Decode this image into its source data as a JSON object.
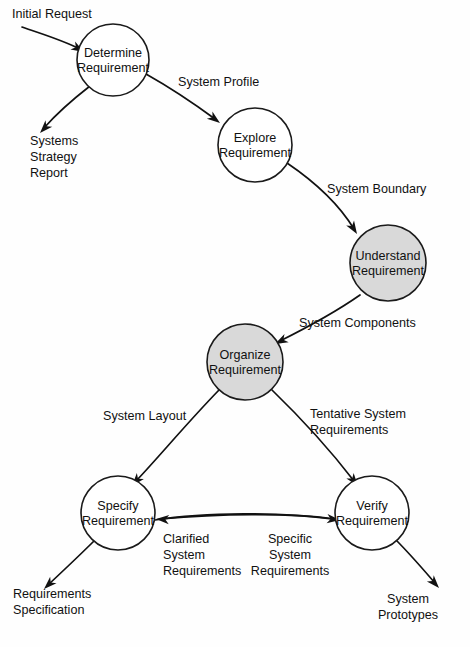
{
  "diagram": {
    "type": "data-flow-diagram",
    "colors": {
      "stroke": "#111111",
      "node_fill": "#ffffff",
      "node_fill_shaded": "#d9d9d9",
      "background": "#fefefe"
    },
    "nodes": [
      {
        "id": "determine",
        "line1": "Determine",
        "line2": "Requirement",
        "cx": 113,
        "cy": 60,
        "r": 36,
        "shaded": false
      },
      {
        "id": "explore",
        "line1": "Explore",
        "line2": "Requirement",
        "cx": 255,
        "cy": 145,
        "r": 37,
        "shaded": false
      },
      {
        "id": "understand",
        "line1": "Understand",
        "line2": "Requirement",
        "cx": 388,
        "cy": 263,
        "r": 38,
        "shaded": true
      },
      {
        "id": "organize",
        "line1": "Organize",
        "line2": "Requirement",
        "cx": 245,
        "cy": 362,
        "r": 38,
        "shaded": true
      },
      {
        "id": "specify",
        "line1": "Specify",
        "line2": "Requirement",
        "cx": 118,
        "cy": 513,
        "r": 37,
        "shaded": false
      },
      {
        "id": "verify",
        "line1": "Verify",
        "line2": "Requirement",
        "cx": 372,
        "cy": 513,
        "r": 37,
        "shaded": false
      }
    ],
    "external_labels": [
      {
        "id": "initial-request",
        "lines": [
          "Initial Request"
        ],
        "x": 12,
        "y": 18,
        "align": "start"
      },
      {
        "id": "systems-strategy-report",
        "lines": [
          "Systems",
          "Strategy",
          "Report"
        ],
        "x": 30,
        "y": 145,
        "align": "start"
      },
      {
        "id": "requirements-specification",
        "lines": [
          "Requirements",
          "Specification"
        ],
        "x": 13,
        "y": 598,
        "align": "start"
      },
      {
        "id": "system-prototypes",
        "lines": [
          "System",
          "Prototypes"
        ],
        "x": 408,
        "y": 603,
        "align": "middle"
      }
    ],
    "flow_labels": [
      {
        "id": "system-profile",
        "lines": [
          "System Profile"
        ],
        "x": 178,
        "y": 86,
        "align": "start"
      },
      {
        "id": "system-boundary",
        "lines": [
          "System Boundary"
        ],
        "x": 327,
        "y": 193,
        "align": "start"
      },
      {
        "id": "system-components",
        "lines": [
          "System Components"
        ],
        "x": 299,
        "y": 327,
        "align": "start"
      },
      {
        "id": "system-layout",
        "lines": [
          "System Layout"
        ],
        "x": 103,
        "y": 420,
        "align": "start"
      },
      {
        "id": "tentative-system-requirements",
        "lines": [
          "Tentative System",
          "Requirements"
        ],
        "x": 310,
        "y": 418,
        "align": "start"
      },
      {
        "id": "clarified-system-requirements",
        "lines": [
          "Clarified",
          "System",
          "Requirements"
        ],
        "x": 163,
        "y": 543,
        "align": "start"
      },
      {
        "id": "specific-system-requirements",
        "lines": [
          "Specific",
          "System",
          "Requirements"
        ],
        "x": 290,
        "y": 543,
        "align": "middle"
      }
    ],
    "edges": [
      {
        "id": "initial-request-to-determine",
        "from": "initial-request",
        "to": "determine",
        "path": "M 22 27 C 48 36, 62 40, 80 49",
        "arrow_x": 84,
        "arrow_y": 52,
        "arrow_angle": 30
      },
      {
        "id": "determine-to-systems-strategy-report",
        "from": "determine",
        "to": "systems-strategy-report",
        "path": "M 90 86 C 72 100, 58 112, 44 128",
        "arrow_x": 40,
        "arrow_y": 133,
        "arrow_angle": 133
      },
      {
        "id": "determine-to-explore",
        "from": "determine",
        "to": "explore",
        "path": "M 146 74 C 178 92, 196 105, 215 119",
        "arrow_x": 220,
        "arrow_y": 123,
        "arrow_angle": 37
      },
      {
        "id": "explore-to-understand",
        "from": "explore",
        "to": "understand",
        "path": "M 287 163 C 318 184, 340 206, 354 229",
        "arrow_x": 357,
        "arrow_y": 234,
        "arrow_angle": 58
      },
      {
        "id": "understand-to-organize",
        "from": "understand",
        "to": "organize",
        "path": "M 360 295 C 330 316, 302 330, 280 341",
        "arrow_x": 275,
        "arrow_y": 344,
        "arrow_angle": 153
      },
      {
        "id": "organize-to-specify",
        "from": "organize",
        "to": "specify",
        "path": "M 219 390 C 186 424, 158 458, 136 481",
        "arrow_x": 132,
        "arrow_y": 486,
        "arrow_angle": 130
      },
      {
        "id": "organize-to-verify",
        "from": "organize",
        "to": "verify",
        "path": "M 272 390 C 304 421, 334 455, 354 481",
        "arrow_x": 358,
        "arrow_y": 486,
        "arrow_angle": 52
      },
      {
        "id": "verify-to-specify",
        "from": "verify",
        "to": "specify",
        "path": "M 338 520 C 290 512, 215 514, 161 519",
        "arrow_x": 156,
        "arrow_y": 519,
        "arrow_angle": 183
      },
      {
        "id": "specify-to-requirements-specification",
        "from": "specify",
        "to": "requirements-specification",
        "path": "M 95 540 C 80 555, 64 570, 48 585",
        "arrow_x": 44,
        "arrow_y": 589,
        "arrow_angle": 136
      },
      {
        "id": "verify-to-system-prototypes",
        "from": "verify",
        "to": "system-prototypes",
        "path": "M 396 540 C 410 554, 422 568, 435 583",
        "arrow_x": 439,
        "arrow_y": 588,
        "arrow_angle": 48
      },
      {
        "id": "specify-to-verify",
        "from": "specify",
        "to": "verify",
        "path": "M 155 520 C 205 512, 282 512, 336 519",
        "arrow_x": 340,
        "arrow_y": 520,
        "arrow_angle": 6
      }
    ]
  }
}
